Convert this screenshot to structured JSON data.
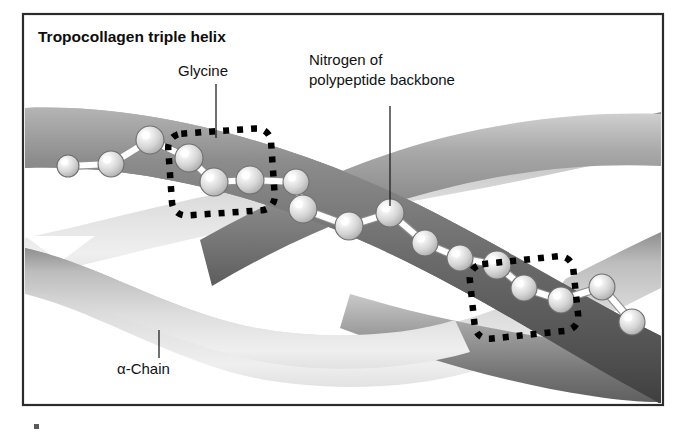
{
  "figure": {
    "title": "Tropocollagen triple helix",
    "labels": {
      "glycine": "Glycine",
      "nitrogen_line1": "Nitrogen of",
      "nitrogen_line2": "polypeptide backbone",
      "alpha_chain": "α-Chain"
    },
    "colors": {
      "frame_stroke": "#2b2b2b",
      "background": "#ffffff",
      "text": "#121212",
      "strand_dark": "#4a4a4a",
      "strand_mid": "#9a9a9a",
      "strand_light": "#e6e6e6",
      "sphere_fill": "#d9d9d9",
      "sphere_highlight": "#ffffff",
      "sphere_outline": "#6f6f6f",
      "bond": "#ffffff",
      "dash_box": "#000000"
    },
    "frame": {
      "x": 23,
      "y": 14,
      "width": 640,
      "height": 391
    },
    "callouts": [
      {
        "name": "glycine",
        "text": "Glycine",
        "text_x": 178,
        "text_y": 76,
        "line_x1": 216,
        "line_y1": 84,
        "line_x2": 216,
        "line_y2": 138
      },
      {
        "name": "nitrogen",
        "text": "Nitrogen of polypeptide backbone",
        "text_x": 309,
        "text_y": 65,
        "line_x1": 390,
        "line_y1": 106,
        "line_x2": 390,
        "line_y2": 206
      },
      {
        "name": "alpha-chain",
        "text": "α-Chain",
        "text_x": 117,
        "text_y": 374,
        "line_x1": 159,
        "line_y1": 330,
        "line_x2": 159,
        "line_y2": 358
      }
    ],
    "dashed_boxes": [
      {
        "name": "glycine-region",
        "x": 170,
        "y": 131,
        "width": 103,
        "height": 82,
        "rotate": -4
      },
      {
        "name": "repeat-region",
        "x": 472,
        "y": 260,
        "width": 104,
        "height": 75,
        "rotate": -6
      }
    ],
    "backbone_spheres": [
      {
        "cx": 68,
        "cy": 166,
        "r": 11
      },
      {
        "cx": 111,
        "cy": 164,
        "r": 13
      },
      {
        "cx": 150,
        "cy": 140,
        "r": 14
      },
      {
        "cx": 189,
        "cy": 158,
        "r": 14
      },
      {
        "cx": 214,
        "cy": 182,
        "r": 14
      },
      {
        "cx": 250,
        "cy": 180,
        "r": 14
      },
      {
        "cx": 296,
        "cy": 182,
        "r": 13
      },
      {
        "cx": 303,
        "cy": 209,
        "r": 14
      },
      {
        "cx": 349,
        "cy": 226,
        "r": 14
      },
      {
        "cx": 390,
        "cy": 213,
        "r": 14
      },
      {
        "cx": 425,
        "cy": 243,
        "r": 13
      },
      {
        "cx": 460,
        "cy": 258,
        "r": 13
      },
      {
        "cx": 497,
        "cy": 265,
        "r": 14
      },
      {
        "cx": 524,
        "cy": 288,
        "r": 13
      },
      {
        "cx": 561,
        "cy": 300,
        "r": 13
      },
      {
        "cx": 602,
        "cy": 287,
        "r": 13
      },
      {
        "cx": 632,
        "cy": 322,
        "r": 13
      }
    ],
    "backbone_bonds": [
      [
        0,
        1
      ],
      [
        1,
        2
      ],
      [
        2,
        3
      ],
      [
        3,
        4
      ],
      [
        4,
        5
      ],
      [
        5,
        6
      ],
      [
        6,
        7
      ],
      [
        7,
        8
      ],
      [
        8,
        9
      ],
      [
        9,
        10
      ],
      [
        10,
        11
      ],
      [
        11,
        12
      ],
      [
        12,
        13
      ],
      [
        13,
        14
      ],
      [
        14,
        15
      ],
      [
        15,
        16
      ]
    ],
    "strands": [
      {
        "name": "alpha-chain-upper",
        "shade": "dark"
      },
      {
        "name": "alpha-chain-middle",
        "shade": "mid"
      },
      {
        "name": "alpha-chain-lower",
        "shade": "light"
      }
    ]
  }
}
